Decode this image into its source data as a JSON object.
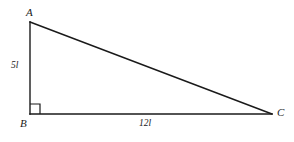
{
  "figure": {
    "type": "right-triangle-diagram",
    "background_color": "#ffffff",
    "stroke_color": "#1a1a1a",
    "vertices": [
      {
        "name": "A",
        "label": "A",
        "x": 30,
        "y": 22
      },
      {
        "name": "B",
        "label": "B",
        "x": 30,
        "y": 114
      },
      {
        "name": "C",
        "label": "C",
        "x": 272,
        "y": 114
      }
    ],
    "sides": [
      {
        "name": "AB",
        "label": "5l",
        "from": "A",
        "to": "B",
        "length_text": "5l"
      },
      {
        "name": "BC",
        "label": "12l",
        "from": "B",
        "to": "C",
        "length_text": "12l"
      },
      {
        "name": "AC",
        "label": "",
        "from": "A",
        "to": "C",
        "length_text": ""
      }
    ],
    "right_angle": {
      "at_vertex": "B",
      "marker": "square",
      "size": 10
    },
    "labels": {
      "vertex_a": "A",
      "vertex_b": "B",
      "vertex_c": "C",
      "side_ab": "5l",
      "side_bc": "12l"
    }
  }
}
